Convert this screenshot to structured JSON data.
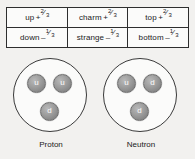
{
  "figure": {
    "background_color": "#f2f1ef",
    "title": ""
  },
  "quark_table": {
    "border_color": "#2e2e2e",
    "rows": [
      [
        {
          "name": "up",
          "sign": "+",
          "numerator": "2",
          "denominator": "3",
          "charge": "+2/3"
        },
        {
          "name": "charm",
          "sign": "+",
          "numerator": "2",
          "denominator": "3",
          "charge": "+2/3"
        },
        {
          "name": "top",
          "sign": "+",
          "numerator": "2",
          "denominator": "3",
          "charge": "+2/3"
        }
      ],
      [
        {
          "name": "down",
          "sign": "–",
          "numerator": "1",
          "denominator": "3",
          "charge": "-1/3"
        },
        {
          "name": "strange",
          "sign": "–",
          "numerator": "1",
          "denominator": "3",
          "charge": "-1/3"
        },
        {
          "name": "bottom",
          "sign": "–",
          "numerator": "1",
          "denominator": "3",
          "charge": "-1/3"
        }
      ]
    ]
  },
  "nucleons": [
    {
      "id": "proton",
      "label": "Proton",
      "quarks": [
        {
          "position": "left",
          "symbol": "u"
        },
        {
          "position": "right",
          "symbol": "u"
        },
        {
          "position": "bottom",
          "symbol": "d"
        }
      ]
    },
    {
      "id": "neutron",
      "label": "Neutron",
      "quarks": [
        {
          "position": "left",
          "symbol": "u"
        },
        {
          "position": "right",
          "symbol": "d"
        },
        {
          "position": "bottom",
          "symbol": "d"
        }
      ]
    }
  ]
}
